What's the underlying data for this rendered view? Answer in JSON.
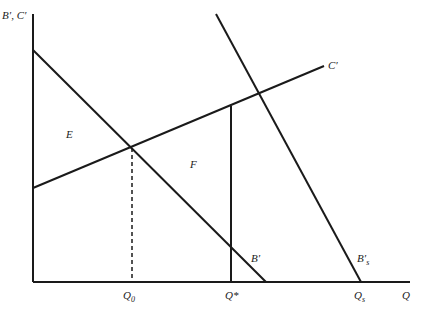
{
  "diagram": {
    "type": "marginal benefit/cost diagram",
    "y_axis_label": "B′, C′",
    "x_axis_label": "Q",
    "curves": [
      {
        "name": "B′",
        "label": "B′",
        "description": "marginal private benefit, downward sloping"
      },
      {
        "name": "C′",
        "label": "C′",
        "description": "marginal cost, upward sloping"
      },
      {
        "name": "B′s",
        "label": "B′",
        "subscript": "s",
        "description": "marginal social benefit, steep downward"
      }
    ],
    "x_ticks": [
      {
        "label": "Q",
        "subscript": "0"
      },
      {
        "label": "Q*",
        "subscript": ""
      },
      {
        "label": "Q",
        "subscript": "s"
      }
    ],
    "regions": [
      {
        "label": "E"
      },
      {
        "label": "F"
      }
    ]
  }
}
